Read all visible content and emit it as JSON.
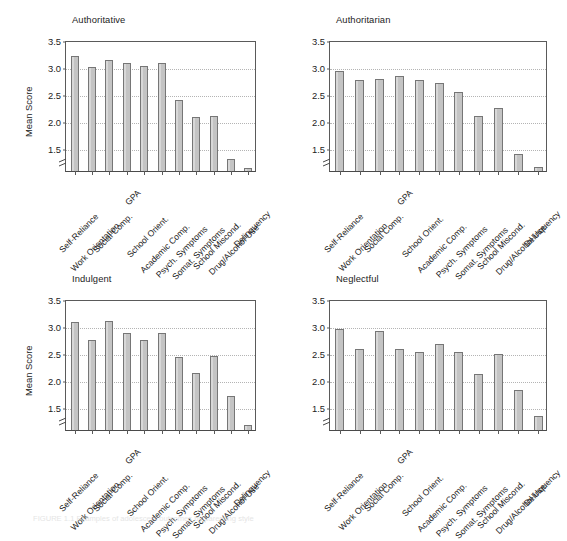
{
  "figure": {
    "caption": "FIGURE 1.1   Examples of adolescent outcomes by parenting style",
    "background": "#ffffff",
    "bar_fill": "#c4c4c4",
    "bar_stroke": "#767676",
    "grid_color": "#b4b4b4",
    "axis_color": "#5a5a5a",
    "text_color": "#1c1c1c"
  },
  "axis": {
    "ylabel": "Mean Score",
    "yticks": [
      1.5,
      2.0,
      2.5,
      3.0,
      3.5
    ],
    "ytick_labels": [
      "1.5",
      "2.0",
      "2.5",
      "3.0",
      "3.5"
    ],
    "ymin_visual": 1.08,
    "ymax": 3.5,
    "axis_break": true,
    "grid": true,
    "legend": "none"
  },
  "categories": [
    "Self-Reliance",
    "Work Orientation",
    "Social Comp.",
    "GPA",
    "School Orient.",
    "Academic Comp.",
    "Psych. Symptoms",
    "Somat. Symptoms",
    "School Miscond.",
    "Drug/Alcohol Use",
    "Delinquency"
  ],
  "panels": [
    {
      "title": "Authoritative",
      "show_ylabel": true
    },
    {
      "title": "Authoritarian",
      "show_ylabel": false
    },
    {
      "title": "Indulgent",
      "show_ylabel": true
    },
    {
      "title": "Neglectful",
      "show_ylabel": false
    }
  ],
  "chart_data": {
    "type": "bar",
    "title": "Examples of adolescent outcomes by parenting style",
    "xlabel": "",
    "ylabel": "Mean Score",
    "ylim": [
      1.08,
      3.5
    ],
    "yticks": [
      1.5,
      2.0,
      2.5,
      3.0,
      3.5
    ],
    "grid": true,
    "legend_position": "none",
    "categories": [
      "Self-Reliance",
      "Work Orientation",
      "Social Comp.",
      "GPA",
      "School Orient.",
      "Academic Comp.",
      "Psych. Symptoms",
      "Somat. Symptoms",
      "School Miscond.",
      "Drug/Alcohol Use",
      "Delinquency"
    ],
    "panel_titles": [
      "Authoritative",
      "Authoritarian",
      "Indulgent",
      "Neglectful"
    ],
    "series": [
      {
        "name": "Authoritative",
        "values": [
          3.21,
          3.01,
          3.13,
          3.07,
          3.02,
          3.07,
          2.39,
          2.08,
          2.1,
          1.31,
          1.14
        ]
      },
      {
        "name": "Authoritarian",
        "values": [
          2.93,
          2.76,
          2.78,
          2.84,
          2.77,
          2.71,
          2.54,
          2.1,
          2.25,
          1.4,
          1.16
        ]
      },
      {
        "name": "Indulgent",
        "values": [
          3.08,
          2.74,
          3.09,
          2.87,
          2.74,
          2.88,
          2.42,
          2.13,
          2.44,
          1.7,
          1.18
        ]
      },
      {
        "name": "Neglectful",
        "values": [
          2.94,
          2.58,
          2.9,
          2.58,
          2.53,
          2.66,
          2.52,
          2.11,
          2.49,
          1.81,
          1.33
        ]
      }
    ]
  }
}
